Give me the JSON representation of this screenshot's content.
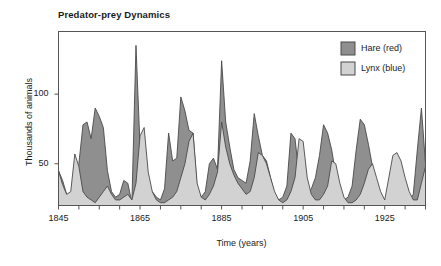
{
  "chart_data": {
    "type": "area",
    "title": "Predator-prey Dynamics",
    "xlabel": "Time (years)",
    "ylabel": "Thousands of animals",
    "xlim": [
      1845,
      1935
    ],
    "ylim": [
      20,
      145
    ],
    "grid": false,
    "legend_position": "top-right",
    "xticks": [
      1845,
      1865,
      1885,
      1905,
      1925
    ],
    "xtick_labels": [
      "1845",
      "1865",
      "1885",
      "1905",
      "1925"
    ],
    "xminor_tick_step": 5,
    "yticks": [
      50,
      100
    ],
    "ytick_labels": [
      "50",
      "100"
    ],
    "colors": {
      "hare": "#8f8f8f",
      "lynx": "#d2d2d2",
      "outline": "#4a4a4a",
      "axis": "#555555",
      "text": "#1a1a1a",
      "background": "#ffffff"
    },
    "x": [
      1845,
      1846,
      1847,
      1848,
      1849,
      1850,
      1851,
      1852,
      1853,
      1854,
      1855,
      1856,
      1857,
      1858,
      1859,
      1860,
      1861,
      1862,
      1863,
      1864,
      1865,
      1866,
      1867,
      1868,
      1869,
      1870,
      1871,
      1872,
      1873,
      1874,
      1875,
      1876,
      1877,
      1878,
      1879,
      1880,
      1881,
      1882,
      1883,
      1884,
      1885,
      1886,
      1887,
      1888,
      1889,
      1890,
      1891,
      1892,
      1893,
      1894,
      1895,
      1896,
      1897,
      1898,
      1899,
      1900,
      1901,
      1902,
      1903,
      1904,
      1905,
      1906,
      1907,
      1908,
      1909,
      1910,
      1911,
      1912,
      1913,
      1914,
      1915,
      1916,
      1917,
      1918,
      1919,
      1920,
      1921,
      1922,
      1923,
      1924,
      1925,
      1926,
      1927,
      1928,
      1929,
      1930,
      1931,
      1932,
      1933,
      1934,
      1935
    ],
    "series": [
      {
        "name": "Hare (red)",
        "legend_label": "Hare (red)",
        "color": "#8f8f8f",
        "values": [
          45,
          38,
          28,
          26,
          30,
          50,
          78,
          80,
          68,
          90,
          84,
          76,
          45,
          30,
          26,
          28,
          38,
          36,
          22,
          135,
          62,
          28,
          26,
          30,
          26,
          24,
          32,
          72,
          52,
          54,
          98,
          88,
          74,
          72,
          32,
          26,
          30,
          50,
          54,
          46,
          124,
          80,
          62,
          46,
          40,
          38,
          36,
          52,
          86,
          70,
          56,
          52,
          40,
          28,
          24,
          26,
          34,
          72,
          68,
          42,
          30,
          28,
          32,
          40,
          56,
          78,
          72,
          60,
          42,
          28,
          24,
          26,
          34,
          60,
          82,
          78,
          64,
          48,
          32,
          26,
          24,
          26,
          34,
          46,
          34,
          26,
          24,
          28,
          60,
          90,
          50
        ]
      },
      {
        "name": "Lynx (blue)",
        "legend_label": "Lynx (blue)",
        "color": "#d2d2d2",
        "values": [
          45,
          35,
          28,
          30,
          57,
          48,
          30,
          26,
          24,
          22,
          26,
          30,
          34,
          28,
          24,
          24,
          26,
          28,
          24,
          36,
          70,
          76,
          44,
          30,
          24,
          22,
          22,
          24,
          26,
          30,
          40,
          50,
          66,
          72,
          36,
          26,
          24,
          28,
          34,
          44,
          80,
          62,
          50,
          42,
          36,
          32,
          28,
          30,
          40,
          58,
          56,
          50,
          40,
          30,
          24,
          22,
          24,
          30,
          40,
          68,
          66,
          40,
          28,
          24,
          24,
          28,
          34,
          52,
          50,
          36,
          26,
          22,
          22,
          24,
          28,
          36,
          46,
          50,
          40,
          30,
          24,
          40,
          56,
          58,
          52,
          40,
          30,
          24,
          24,
          36,
          48
        ]
      }
    ]
  },
  "legend": {
    "items": [
      {
        "label": "Hare (red)",
        "color": "#8f8f8f"
      },
      {
        "label": "Lynx (blue)",
        "color": "#d2d2d2"
      }
    ]
  }
}
